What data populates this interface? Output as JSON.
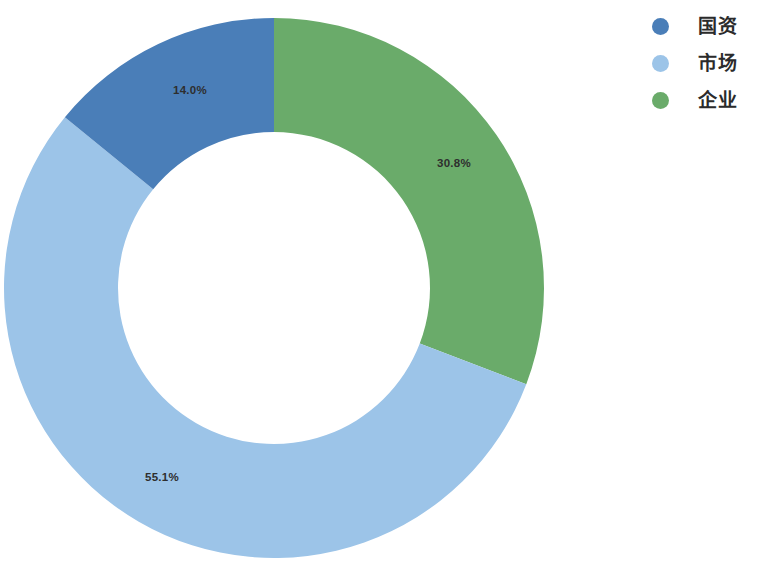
{
  "chart_data": {
    "type": "pie",
    "variant": "donut",
    "title": "",
    "xlabel": "",
    "ylabel": "",
    "categories": [
      "企业",
      "市场",
      "国资"
    ],
    "values": [
      30.8,
      55.1,
      14.0
    ],
    "value_unit": "%",
    "data_labels": [
      "30.8%",
      "55.1%",
      "14.0%"
    ],
    "colors": [
      "#6aab6a",
      "#9cc4e8",
      "#4a7eb8"
    ],
    "legend": {
      "position": "right",
      "entries": [
        {
          "label": "国资",
          "color": "#4a7eb8",
          "value": 14.0,
          "value_label": "14.0%"
        },
        {
          "label": "市场",
          "color": "#9cc4e8",
          "value": 55.1,
          "value_label": "55.1%"
        },
        {
          "label": "企业",
          "color": "#6aab6a",
          "value": 30.8,
          "value_label": "30.8%"
        }
      ]
    },
    "grid": false,
    "start_angle_deg": 0,
    "direction": "clockwise",
    "inner_radius_ratio": 0.578,
    "background": "#ffffff",
    "label_color": "#2e2e2e",
    "slices": [
      {
        "name": "企业",
        "value": 30.8,
        "label": "30.8%",
        "color": "#6aab6a",
        "start_deg": 0,
        "end_deg": 110.88,
        "label_x": 454,
        "label_y": 167
      },
      {
        "name": "市场",
        "value": 55.1,
        "label": "55.1%",
        "color": "#9cc4e8",
        "start_deg": 110.88,
        "end_deg": 309.24,
        "label_x": 162,
        "label_y": 481
      },
      {
        "name": "国资",
        "value": 14.0,
        "label": "14.0%",
        "color": "#4a7eb8",
        "start_deg": 309.24,
        "end_deg": 360,
        "label_x": 190,
        "label_y": 94
      }
    ],
    "geometry": {
      "center_x": 274,
      "center_y": 288,
      "outer_radius": 270,
      "inner_radius": 156
    }
  }
}
